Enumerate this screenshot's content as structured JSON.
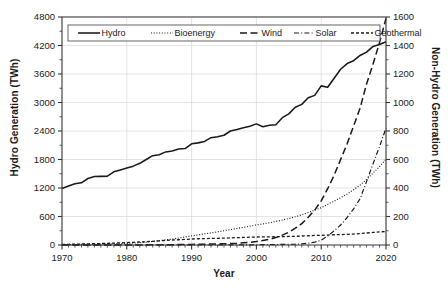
{
  "chart_data": {
    "type": "line",
    "title": "",
    "xlabel": "Year",
    "ylabel": "Hydro Generation (TWh)",
    "ylabel_right": "Non-Hydro Generation (TWh)",
    "grid": true,
    "legend_position": "top-inside",
    "xlim": [
      1970,
      2020
    ],
    "ylim": [
      0,
      4800
    ],
    "ylim_right": [
      0,
      1600
    ],
    "xticks": [
      1970,
      1980,
      1990,
      2000,
      2010,
      2020
    ],
    "xtick_labels": [
      "1970",
      "1980",
      "1990",
      "2000",
      "2010",
      "2020"
    ],
    "yticks": [
      0,
      600,
      1200,
      1800,
      2400,
      3000,
      3600,
      4200,
      4800
    ],
    "ytick_labels": [
      "0",
      "600",
      "1200",
      "1800",
      "2400",
      "3000",
      "3600",
      "4200",
      "4800"
    ],
    "yticks_right": [
      0,
      200,
      400,
      600,
      800,
      1000,
      1200,
      1400,
      1600
    ],
    "ytick_labels_right": [
      "0",
      "200",
      "400",
      "600",
      "800",
      "1000",
      "1200",
      "1400",
      "1600"
    ],
    "x": [
      1970,
      1971,
      1972,
      1973,
      1974,
      1975,
      1976,
      1977,
      1978,
      1979,
      1980,
      1981,
      1982,
      1983,
      1984,
      1985,
      1986,
      1987,
      1988,
      1989,
      1990,
      1991,
      1992,
      1993,
      1994,
      1995,
      1996,
      1997,
      1998,
      1999,
      2000,
      2001,
      2002,
      2003,
      2004,
      2005,
      2006,
      2007,
      2008,
      2009,
      2010,
      2011,
      2012,
      2013,
      2014,
      2015,
      2016,
      2017,
      2018,
      2019,
      2020
    ],
    "series": [
      {
        "name": "Hydro",
        "axis": "left",
        "style": "solid",
        "units": "TWh",
        "values": [
          1190,
          1240,
          1290,
          1310,
          1400,
          1440,
          1445,
          1450,
          1540,
          1580,
          1620,
          1660,
          1720,
          1800,
          1880,
          1900,
          1960,
          1980,
          2020,
          2030,
          2130,
          2150,
          2180,
          2260,
          2280,
          2310,
          2400,
          2430,
          2470,
          2500,
          2550,
          2490,
          2520,
          2530,
          2680,
          2760,
          2900,
          2960,
          3100,
          3150,
          3350,
          3320,
          3510,
          3700,
          3820,
          3880,
          3990,
          4060,
          4180,
          4220,
          4280
        ]
      },
      {
        "name": "Bioenergy",
        "axis": "right",
        "style": "dotted",
        "units": "TWh",
        "values": [
          2,
          3,
          3,
          4,
          4,
          5,
          6,
          7,
          8,
          9,
          11,
          13,
          16,
          20,
          25,
          30,
          36,
          42,
          49,
          56,
          64,
          71,
          78,
          85,
          92,
          100,
          108,
          116,
          124,
          132,
          141,
          148,
          156,
          165,
          175,
          186,
          198,
          212,
          228,
          244,
          262,
          285,
          308,
          332,
          358,
          388,
          420,
          460,
          505,
          550,
          600
        ]
      },
      {
        "name": "Wind",
        "axis": "right",
        "style": "dash-long",
        "units": "TWh",
        "values": [
          0,
          0,
          0,
          0,
          0,
          0,
          0,
          0,
          0,
          0,
          0,
          0,
          0,
          1,
          1,
          1,
          2,
          2,
          3,
          3,
          4,
          5,
          6,
          7,
          8,
          9,
          10,
          12,
          15,
          19,
          25,
          32,
          40,
          52,
          69,
          90,
          118,
          150,
          194,
          245,
          310,
          395,
          490,
          600,
          710,
          835,
          960,
          1130,
          1270,
          1420,
          1590
        ]
      },
      {
        "name": "Solar",
        "axis": "right",
        "style": "dash-dot",
        "units": "TWh",
        "values": [
          0,
          0,
          0,
          0,
          0,
          0,
          0,
          0,
          0,
          0,
          0,
          0,
          0,
          0,
          0,
          0,
          0,
          0,
          0,
          0,
          0,
          0,
          0,
          0,
          0,
          1,
          1,
          1,
          1,
          1,
          1,
          2,
          2,
          3,
          4,
          5,
          6,
          8,
          12,
          20,
          33,
          63,
          100,
          140,
          193,
          253,
          325,
          445,
          570,
          690,
          820
        ]
      },
      {
        "name": "Geothermal",
        "axis": "right",
        "style": "dash-short",
        "units": "TWh",
        "values": [
          4,
          5,
          6,
          7,
          8,
          9,
          10,
          12,
          13,
          15,
          17,
          19,
          21,
          23,
          26,
          29,
          32,
          35,
          37,
          39,
          42,
          44,
          45,
          46,
          47,
          48,
          50,
          52,
          53,
          55,
          56,
          57,
          57,
          58,
          59,
          60,
          61,
          63,
          65,
          67,
          68,
          70,
          72,
          73,
          75,
          77,
          80,
          84,
          88,
          92,
          95
        ]
      }
    ]
  }
}
